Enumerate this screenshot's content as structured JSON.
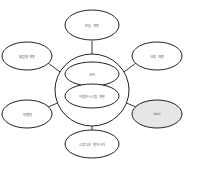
{
  "diagram": {
    "center": {
      "top_label": "코어",
      "bottom_label": "어댑터시스템 개발"
    },
    "nodes": [
      {
        "id": "top",
        "label": "모듈 개발",
        "fill": "#ffffff"
      },
      {
        "id": "top-left",
        "label": "협업형 개발",
        "fill": "#ffffff"
      },
      {
        "id": "top-right",
        "label": "내장 개발",
        "fill": "#ffffff"
      },
      {
        "id": "bottom-left",
        "label": "모델링",
        "fill": "#ffffff"
      },
      {
        "id": "bottom-right",
        "label": "DAO",
        "fill": "#e6e6e6"
      },
      {
        "id": "bottom",
        "label": "스튜디오 엔지니어",
        "fill": "#ffffff"
      }
    ],
    "colors": {
      "stroke": "#222222",
      "highlight_fill": "#e6e6e6"
    }
  }
}
